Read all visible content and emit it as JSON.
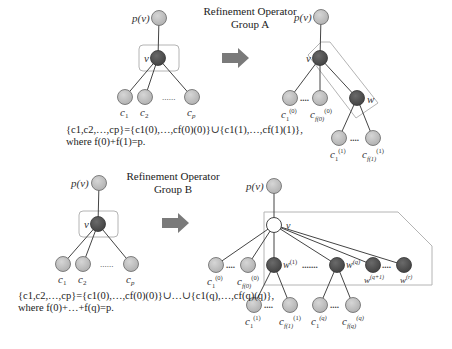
{
  "group_a": {
    "title_line1": "Refinement Operator",
    "title_line2": "Group A",
    "before": {
      "parent_label": "p(v)",
      "node_label": "v",
      "children": [
        "c1",
        "c2",
        "cp"
      ],
      "ellipsis": "......"
    },
    "after": {
      "parent_label": "p(v)",
      "node_label": "v",
      "new_node_label": "w",
      "v_children": [
        "c1(0)",
        "cf(0)(0)"
      ],
      "w_children": [
        "c1(1)",
        "cf(1)(1)"
      ],
      "ellipsis": "...."
    },
    "formula_line1": "{c1,c2,…,cp}={c1(0),…,cf(0)(0)}∪{c1(1),…,cf(1)(1)},",
    "formula_line2": "where f(0)+f(1)=p."
  },
  "group_b": {
    "title_line1": "Refinement Operator",
    "title_line2": "Group B",
    "before": {
      "parent_label": "p(v)",
      "node_label": "v",
      "children": [
        "c1",
        "c2",
        "cp"
      ],
      "ellipsis": "......"
    },
    "after": {
      "parent_label": "p(v)",
      "node_label": "v",
      "v_children": [
        "c1(0)",
        "cf(0)(0)"
      ],
      "new_nodes": [
        "w(1)",
        "w(q)",
        "w(q+1)",
        "w(r)"
      ],
      "w1_children": [
        "c1(1)",
        "cf(1)(1)"
      ],
      "wq_children": [
        "c1(q)",
        "cf(q)(q)"
      ],
      "ellipsis_short": "....",
      "ellipsis_long": "......."
    },
    "formula_line1": "{c1,c2,…,cp}={c1(0),…,cf(0)(0)}∪…∪{c1(q),…,cf(q)(q)},",
    "formula_line2": "where f(0)+…+f(q)=p."
  },
  "colors": {
    "light_node": "#c4c4c4",
    "dark_node": "#555555",
    "white_node": "#ffffff",
    "edge": "#444444",
    "box": "#b0b0b0",
    "arrow": "#7a7a7a"
  }
}
